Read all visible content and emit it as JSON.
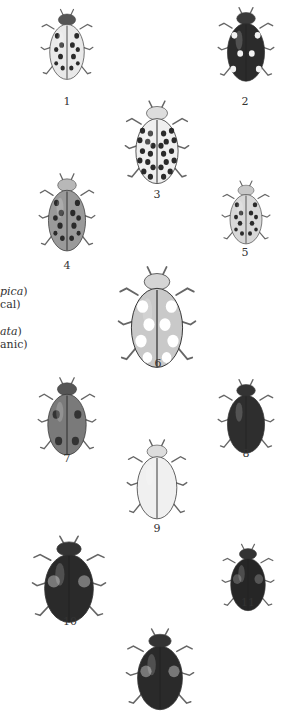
{
  "plate": {
    "figures": [
      {
        "label": "1",
        "pattern": "pale-spotted-black-suture",
        "x": 67,
        "y": 45,
        "w": 54,
        "h": 78,
        "elytra": "#e9e9e9",
        "spot": "#2a2a2a",
        "pron": "#555",
        "spots": "pale"
      },
      {
        "label": "2",
        "pattern": "dark-with-pale-spots",
        "x": 246,
        "y": 45,
        "w": 58,
        "h": 82,
        "elytra": "#2b2b2b",
        "spot": "#f2f2f2",
        "pron": "#3a3a3a",
        "spots": "dark"
      },
      {
        "label": "3",
        "pattern": "22-spot",
        "x": 157,
        "y": 143,
        "w": 66,
        "h": 92,
        "elytra": "#efefef",
        "spot": "#2a2a2a",
        "pron": "#ddd",
        "spots": "many"
      },
      {
        "label": "4",
        "pattern": "grey-spotted",
        "x": 67,
        "y": 213,
        "w": 58,
        "h": 86,
        "elytra": "#9a9a9a",
        "spot": "#2a2a2a",
        "pron": "#b8b8b8",
        "spots": "grey"
      },
      {
        "label": "5",
        "pattern": "small-spotted",
        "x": 246,
        "y": 213,
        "w": 50,
        "h": 70,
        "elytra": "#d8d8d8",
        "spot": "#2a2a2a",
        "pron": "#c8c8c8",
        "spots": "small"
      },
      {
        "label": "6",
        "pattern": "large-pale-spotted",
        "x": 157,
        "y": 318,
        "w": 80,
        "h": 112,
        "elytra": "#c9c9c9",
        "spot": "#ffffff",
        "pron": "#d5d5d5",
        "spots": "large"
      },
      {
        "label": "7",
        "pattern": "four-spot-grey",
        "x": 67,
        "y": 417,
        "w": 60,
        "h": 86,
        "elytra": "#7a7a7a",
        "spot": "#333",
        "pron": "#555",
        "spots": "four"
      },
      {
        "label": "8",
        "pattern": "dark-melanic",
        "x": 246,
        "y": 417,
        "w": 58,
        "h": 82,
        "elytra": "#2e2e2e",
        "spot": "#2e2e2e",
        "pron": "#333",
        "spots": "none"
      },
      {
        "label": "9",
        "pattern": "pale-immaculate",
        "x": 157,
        "y": 480,
        "w": 62,
        "h": 88,
        "elytra": "#f0f0f0",
        "spot": "#f0f0f0",
        "pron": "#ddd",
        "spots": "none"
      },
      {
        "label": "10",
        "pattern": "large-melanic-rimmed",
        "x": 69,
        "y": 580,
        "w": 76,
        "h": 96,
        "elytra": "#2a2a2a",
        "spot": "#777",
        "pron": "#333",
        "spots": "rim"
      },
      {
        "label": "11",
        "pattern": "small-melanic-rimmed",
        "x": 248,
        "y": 578,
        "w": 54,
        "h": 74,
        "elytra": "#262626",
        "spot": "#555",
        "pron": "#333",
        "spots": "rim"
      },
      {
        "label": "12",
        "pattern": "melanic-rimmed",
        "x": 160,
        "y": 670,
        "w": 70,
        "h": 90,
        "elytra": "#2a2a2a",
        "spot": "#777",
        "pron": "#333",
        "spots": "rim"
      }
    ],
    "labels": [
      {
        "text": "1",
        "x": 67,
        "y": 102
      },
      {
        "text": "2",
        "x": 245,
        "y": 102
      },
      {
        "text": "3",
        "x": 157,
        "y": 195
      },
      {
        "text": "4",
        "x": 67,
        "y": 266
      },
      {
        "text": "5",
        "x": 245,
        "y": 253
      },
      {
        "text": "6",
        "x": 158,
        "y": 364
      },
      {
        "text": "7",
        "x": 67,
        "y": 459
      },
      {
        "text": "8",
        "x": 246,
        "y": 454
      },
      {
        "text": "9",
        "x": 157,
        "y": 529
      },
      {
        "text": "10",
        "x": 70,
        "y": 622
      },
      {
        "text": "11",
        "x": 248,
        "y": 603
      }
    ],
    "side_text": {
      "line1_italic": "pica",
      "line1_tail": ")",
      "line2": "cal)",
      "line3_italic": "ata",
      "line3_tail": ")",
      "line4": "anic)"
    }
  }
}
